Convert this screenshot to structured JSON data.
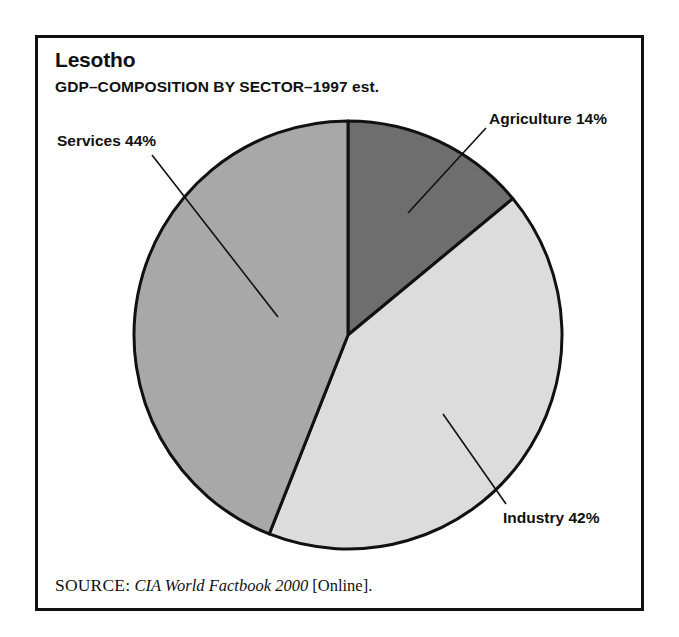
{
  "figure": {
    "title": "Lesotho",
    "subtitle": "GDP–COMPOSITION BY SECTOR–1997 est.",
    "source": {
      "label": "SOURCE:",
      "publication": "CIA World Factbook 2000",
      "medium": "[Online]."
    }
  },
  "labels": {
    "agriculture": "Agriculture 14%",
    "services": "Services 44%",
    "industry": "Industry 42%"
  },
  "colors": {
    "agriculture": "#6e6e6e",
    "services": "#a8a8a8",
    "industry": "#dcdcdc",
    "outline": "#111111",
    "background": "#ffffff",
    "text": "#111111"
  },
  "chart_data": {
    "type": "pie",
    "title": "Lesotho",
    "subtitle": "GDP–COMPOSITION BY SECTOR–1997 est.",
    "categories": [
      "Agriculture",
      "Industry",
      "Services"
    ],
    "values": [
      14,
      42,
      44
    ],
    "unit": "percent",
    "data_labels": [
      "Agriculture 14%",
      "Industry 42%",
      "Services 44%"
    ],
    "slice_colors": [
      "#6e6e6e",
      "#dcdcdc",
      "#a8a8a8"
    ],
    "start_angle_deg": 0,
    "direction": "clockwise",
    "total": 100,
    "legend": "none",
    "grid": false,
    "xlabel": "",
    "ylabel": "",
    "annotations": [
      "SOURCE: CIA World Factbook 2000 [Online]."
    ]
  }
}
